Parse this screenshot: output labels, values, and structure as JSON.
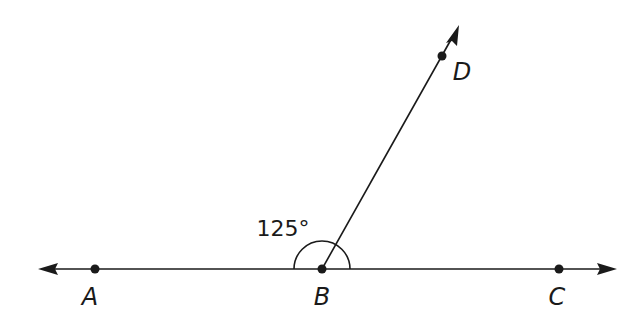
{
  "diagram": {
    "points": [
      {
        "id": "A",
        "label": "A"
      },
      {
        "id": "B",
        "label": "B"
      },
      {
        "id": "C",
        "label": "C"
      },
      {
        "id": "D",
        "label": "D"
      }
    ],
    "lines": [
      {
        "id": "line-AC",
        "through": [
          "A",
          "B",
          "C"
        ],
        "arrows": "both"
      },
      {
        "id": "ray-BD",
        "from": "B",
        "through": "D",
        "arrows": "end"
      }
    ],
    "angle": {
      "vertex": "B",
      "between": [
        "D",
        "A"
      ],
      "label": "125°",
      "value_degrees": 125
    },
    "colors": {
      "stroke": "#1a1a1a",
      "background": "#ffffff"
    }
  }
}
